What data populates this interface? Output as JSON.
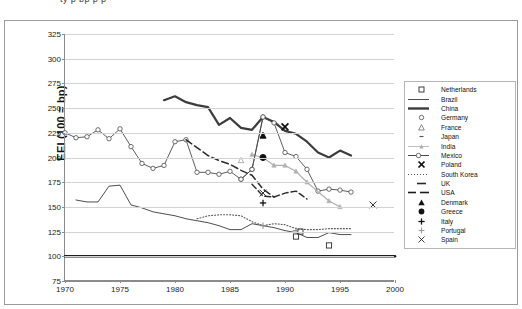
{
  "page": {
    "top_fragment": "ty       p        bp        p              p",
    "background": "#ffffff"
  },
  "chart_data": {
    "type": "line",
    "title": "",
    "xlabel": "",
    "ylabel": "EEI (100 = bp)",
    "xlim": [
      1970,
      2000
    ],
    "ylim": [
      75,
      325
    ],
    "xticks": [
      1970,
      1975,
      1980,
      1985,
      1990,
      1995,
      2000
    ],
    "yticks": [
      75,
      100,
      125,
      150,
      175,
      200,
      225,
      250,
      275,
      300,
      325
    ],
    "grid": true,
    "legend_position": "right",
    "series": [
      {
        "name": "Netherlands",
        "marker": "open-square",
        "line": "none",
        "color": "#2b2b2b",
        "x": [
          1991,
          1991.4,
          1994
        ],
        "values": [
          120,
          125,
          111
        ]
      },
      {
        "name": "Brazil",
        "marker": "none",
        "line": "thin-solid",
        "color": "#3a3a3a",
        "x": [
          1971,
          1972,
          1973,
          1974,
          1975,
          1976,
          1977,
          1978,
          1979,
          1980,
          1981,
          1982,
          1983,
          1984,
          1985,
          1986,
          1987,
          1988,
          1989,
          1990,
          1991,
          1992,
          1993,
          1994,
          1995,
          1996
        ],
        "values": [
          157,
          155,
          155,
          171,
          172,
          152,
          149,
          145,
          143,
          141,
          138,
          136,
          134,
          131,
          127,
          127,
          133,
          131,
          129,
          126,
          124,
          119,
          119,
          124,
          122,
          122
        ]
      },
      {
        "name": "China",
        "marker": "none",
        "line": "thick-solid",
        "color": "#3c3c3c",
        "x": [
          1979,
          1980,
          1981,
          1982,
          1983,
          1984,
          1985,
          1986,
          1987,
          1988,
          1989,
          1990,
          1991,
          1992,
          1993,
          1994,
          1995,
          1996
        ],
        "values": [
          258,
          262,
          256,
          253,
          251,
          233,
          240,
          230,
          228,
          241,
          236,
          227,
          224,
          216,
          205,
          200,
          207,
          202
        ]
      },
      {
        "name": "Germany",
        "marker": "open-circle",
        "line": "thin-solid",
        "color": "#4a4a4a",
        "x": [
          1970,
          1971,
          1972,
          1973,
          1974,
          1975,
          1976,
          1977,
          1978,
          1979,
          1980,
          1981,
          1982,
          1983,
          1984,
          1985,
          1986,
          1987,
          1988,
          1989,
          1990,
          1991,
          1992,
          1993,
          1994,
          1995,
          1996
        ],
        "values": [
          225,
          220,
          221,
          228,
          219,
          229,
          211,
          194,
          189,
          192,
          216,
          218,
          185,
          185,
          183,
          186,
          178,
          188,
          241,
          235,
          205,
          201,
          188,
          166,
          168,
          167,
          165
        ]
      },
      {
        "name": "France",
        "marker": "open-triangle",
        "line": "none",
        "color": "#9a9a9a",
        "x": [
          1986
        ],
        "values": [
          197
        ]
      },
      {
        "name": "Japan",
        "marker": "tiny-dash",
        "line": "none",
        "color": "#555555",
        "x": [],
        "values": []
      },
      {
        "name": "India",
        "marker": "gray-triangle",
        "line": "gray-solid",
        "color": "#b0b0b0",
        "x": [
          1987,
          1988,
          1989,
          1990,
          1991,
          1992,
          1994,
          1995
        ],
        "values": [
          203,
          200,
          192,
          192,
          186,
          175,
          156,
          150
        ]
      },
      {
        "name": "Mexico",
        "marker": "open-circle",
        "line": "thin-solid",
        "color": "#4a4a4a",
        "x": [
          1986,
          1987,
          1988
        ],
        "values": [
          178,
          188,
          241
        ]
      },
      {
        "name": "Poland",
        "marker": "bold-x",
        "line": "none",
        "color": "#111111",
        "x": [
          1990
        ],
        "values": [
          231
        ]
      },
      {
        "name": "South Korea",
        "marker": "none",
        "line": "dotted",
        "color": "#555555",
        "x": [
          1982,
          1983,
          1984,
          1985,
          1986,
          1987,
          1988,
          1989,
          1990,
          1991,
          1992,
          1993,
          1994,
          1995,
          1996
        ],
        "values": [
          138,
          141,
          142,
          142,
          141,
          135,
          131,
          133,
          132,
          128,
          127,
          127,
          128,
          128,
          128
        ]
      },
      {
        "name": "UK",
        "marker": "none",
        "line": "dashed",
        "color": "#2b2b2b",
        "x": [
          1987,
          1988,
          1989,
          1990,
          1991,
          1992
        ],
        "values": [
          173,
          161,
          160,
          164,
          166,
          158
        ]
      },
      {
        "name": "USA",
        "marker": "none",
        "line": "thick-flat",
        "color": "#1c1c1c",
        "x": [
          1970,
          2000
        ],
        "values": [
          100,
          100
        ]
      },
      {
        "name": "Denmark",
        "marker": "filled-triangle",
        "line": "none",
        "color": "#111111",
        "x": [
          1988
        ],
        "values": [
          222
        ]
      },
      {
        "name": "Greece",
        "marker": "filled-circle",
        "line": "none",
        "color": "#111111",
        "x": [
          1988
        ],
        "values": [
          200
        ]
      },
      {
        "name": "Italy",
        "marker": "plus",
        "line": "none",
        "color": "#111111",
        "x": [
          1988
        ],
        "values": [
          154
        ]
      },
      {
        "name": "Portugal",
        "marker": "gray-plus",
        "line": "none",
        "color": "#8a8a8a",
        "x": [
          1988,
          1991
        ],
        "values": [
          131,
          126
        ]
      },
      {
        "name": "Spain",
        "marker": "thin-x",
        "line": "none",
        "color": "#2b2b2b",
        "x": [
          1988,
          1998
        ],
        "values": [
          164,
          152
        ]
      }
    ],
    "france_dashed_path": {
      "name": "France dashed trend",
      "x": [
        1981,
        1982,
        1983,
        1984,
        1985,
        1986,
        1987,
        1988,
        1989
      ],
      "values": [
        218,
        210,
        202,
        197,
        193,
        187,
        182,
        168,
        160
      ]
    }
  },
  "legend": {
    "items": [
      {
        "label": "Netherlands",
        "key": "open-square"
      },
      {
        "label": "Brazil",
        "key": "thin-line"
      },
      {
        "label": "China",
        "key": "thick-line"
      },
      {
        "label": "Germany",
        "key": "open-circle"
      },
      {
        "label": "France",
        "key": "open-triangle"
      },
      {
        "label": "Japan",
        "key": "tiny-dash"
      },
      {
        "label": "India",
        "key": "gray-line-triangle"
      },
      {
        "label": "Mexico",
        "key": "line-circle"
      },
      {
        "label": "Poland",
        "key": "bold-x"
      },
      {
        "label": "South Korea",
        "key": "dotted-line"
      },
      {
        "label": "UK",
        "key": "dash"
      },
      {
        "label": "USA",
        "key": "long-dash"
      },
      {
        "label": "Denmark",
        "key": "filled-triangle"
      },
      {
        "label": "Greece",
        "key": "filled-circle"
      },
      {
        "label": "Italy",
        "key": "plus"
      },
      {
        "label": "Portugal",
        "key": "gray-plus"
      },
      {
        "label": "Spain",
        "key": "thin-x"
      }
    ]
  }
}
